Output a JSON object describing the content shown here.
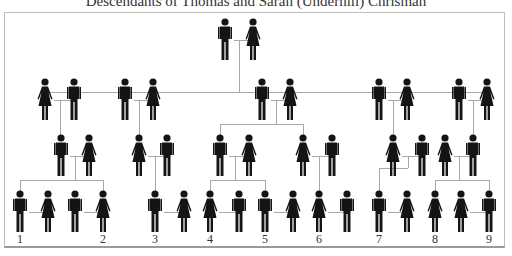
{
  "title": "Descendants of Thomas and Sarah (Underhill) Chrisman",
  "colors": {
    "figure": "#141414",
    "line": "#a9a9a9",
    "border": "#bdbdbd"
  },
  "generations": [
    {
      "row": 1,
      "figures": [
        {
          "id": "g1-m",
          "sex": "male",
          "x": 225,
          "y": 18
        },
        {
          "id": "g1-f",
          "sex": "female",
          "x": 253,
          "y": 18
        }
      ]
    },
    {
      "row": 2,
      "figures": [
        {
          "id": "g2-a-f",
          "sex": "female",
          "x": 45,
          "y": 78
        },
        {
          "id": "g2-a-m",
          "sex": "male",
          "x": 74,
          "y": 78
        },
        {
          "id": "g2-b-m",
          "sex": "male",
          "x": 125,
          "y": 78
        },
        {
          "id": "g2-b-f",
          "sex": "female",
          "x": 153,
          "y": 78
        },
        {
          "id": "g2-c-m",
          "sex": "male",
          "x": 262,
          "y": 78
        },
        {
          "id": "g2-c-f",
          "sex": "female",
          "x": 290,
          "y": 78
        },
        {
          "id": "g2-d-m",
          "sex": "male",
          "x": 379,
          "y": 78
        },
        {
          "id": "g2-d-f",
          "sex": "female",
          "x": 407,
          "y": 78
        },
        {
          "id": "g2-e-m",
          "sex": "male",
          "x": 459,
          "y": 78
        },
        {
          "id": "g2-e-f",
          "sex": "female",
          "x": 487,
          "y": 78
        }
      ]
    },
    {
      "row": 3,
      "figures": [
        {
          "id": "g3-a-m",
          "sex": "male",
          "x": 61,
          "y": 134
        },
        {
          "id": "g3-a-f",
          "sex": "female",
          "x": 89,
          "y": 134
        },
        {
          "id": "g3-b-f",
          "sex": "female",
          "x": 139,
          "y": 134
        },
        {
          "id": "g3-b-m",
          "sex": "male",
          "x": 167,
          "y": 134
        },
        {
          "id": "g3-c1-m",
          "sex": "male",
          "x": 220,
          "y": 134
        },
        {
          "id": "g3-c1-f",
          "sex": "female",
          "x": 249,
          "y": 134
        },
        {
          "id": "g3-c2-f",
          "sex": "female",
          "x": 303,
          "y": 134
        },
        {
          "id": "g3-c2-m",
          "sex": "male",
          "x": 332,
          "y": 134
        },
        {
          "id": "g3-d-f",
          "sex": "female",
          "x": 393,
          "y": 134
        },
        {
          "id": "g3-d-m",
          "sex": "male",
          "x": 422,
          "y": 134
        },
        {
          "id": "g3-e-f",
          "sex": "female",
          "x": 445,
          "y": 134
        },
        {
          "id": "g3-e-m",
          "sex": "male",
          "x": 473,
          "y": 134
        }
      ]
    },
    {
      "row": 4,
      "figures": [
        {
          "id": "g4-1",
          "sex": "male",
          "x": 20,
          "y": 190,
          "label": "1"
        },
        {
          "id": "g4-1s",
          "sex": "female",
          "x": 48,
          "y": 190
        },
        {
          "id": "g4-2s",
          "sex": "male",
          "x": 75,
          "y": 190
        },
        {
          "id": "g4-2",
          "sex": "female",
          "x": 103,
          "y": 190,
          "label": "2"
        },
        {
          "id": "g4-3",
          "sex": "male",
          "x": 155,
          "y": 190,
          "label": "3"
        },
        {
          "id": "g4-3s",
          "sex": "female",
          "x": 184,
          "y": 190
        },
        {
          "id": "g4-4",
          "sex": "female",
          "x": 210,
          "y": 190,
          "label": "4"
        },
        {
          "id": "g4-4s",
          "sex": "male",
          "x": 239,
          "y": 190
        },
        {
          "id": "g4-5",
          "sex": "male",
          "x": 265,
          "y": 190,
          "label": "5"
        },
        {
          "id": "g4-5s",
          "sex": "female",
          "x": 293,
          "y": 190
        },
        {
          "id": "g4-6",
          "sex": "female",
          "x": 319,
          "y": 190,
          "label": "6"
        },
        {
          "id": "g4-6s",
          "sex": "male",
          "x": 347,
          "y": 190
        },
        {
          "id": "g4-7",
          "sex": "male",
          "x": 379,
          "y": 190,
          "label": "7"
        },
        {
          "id": "g4-7s",
          "sex": "female",
          "x": 407,
          "y": 190
        },
        {
          "id": "g4-8",
          "sex": "female",
          "x": 435,
          "y": 190,
          "label": "8"
        },
        {
          "id": "g4-8s",
          "sex": "female",
          "x": 461,
          "y": 190
        },
        {
          "id": "g4-9",
          "sex": "male",
          "x": 489,
          "y": 190,
          "label": "9"
        }
      ]
    }
  ],
  "labels": [
    "1",
    "2",
    "3",
    "4",
    "5",
    "6",
    "7",
    "8",
    "9"
  ],
  "lines": [
    {
      "x1": 234,
      "y1": 40,
      "x2": 253,
      "y2": 40
    },
    {
      "x1": 239,
      "y1": 40,
      "x2": 239,
      "y2": 92
    },
    {
      "x1": 45,
      "y1": 92,
      "x2": 487,
      "y2": 92
    },
    {
      "x1": 45,
      "y1": 92,
      "x2": 45,
      "y2": 100
    },
    {
      "x1": 125,
      "y1": 92,
      "x2": 125,
      "y2": 100
    },
    {
      "x1": 262,
      "y1": 92,
      "x2": 262,
      "y2": 100
    },
    {
      "x1": 379,
      "y1": 92,
      "x2": 379,
      "y2": 100
    },
    {
      "x1": 487,
      "y1": 92,
      "x2": 487,
      "y2": 100
    },
    {
      "x1": 54,
      "y1": 100,
      "x2": 74,
      "y2": 100
    },
    {
      "x1": 60,
      "y1": 100,
      "x2": 60,
      "y2": 136
    },
    {
      "x1": 134,
      "y1": 100,
      "x2": 153,
      "y2": 100
    },
    {
      "x1": 139,
      "y1": 100,
      "x2": 139,
      "y2": 136
    },
    {
      "x1": 271,
      "y1": 100,
      "x2": 290,
      "y2": 100
    },
    {
      "x1": 276,
      "y1": 100,
      "x2": 276,
      "y2": 124
    },
    {
      "x1": 220,
      "y1": 124,
      "x2": 303,
      "y2": 124
    },
    {
      "x1": 220,
      "y1": 124,
      "x2": 220,
      "y2": 136
    },
    {
      "x1": 303,
      "y1": 124,
      "x2": 303,
      "y2": 136
    },
    {
      "x1": 388,
      "y1": 100,
      "x2": 407,
      "y2": 100
    },
    {
      "x1": 393,
      "y1": 100,
      "x2": 393,
      "y2": 136
    },
    {
      "x1": 468,
      "y1": 100,
      "x2": 487,
      "y2": 100
    },
    {
      "x1": 473,
      "y1": 100,
      "x2": 473,
      "y2": 136
    },
    {
      "x1": 70,
      "y1": 156,
      "x2": 89,
      "y2": 156
    },
    {
      "x1": 75,
      "y1": 156,
      "x2": 75,
      "y2": 180
    },
    {
      "x1": 20,
      "y1": 180,
      "x2": 103,
      "y2": 180
    },
    {
      "x1": 20,
      "y1": 180,
      "x2": 20,
      "y2": 192
    },
    {
      "x1": 103,
      "y1": 180,
      "x2": 103,
      "y2": 192
    },
    {
      "x1": 148,
      "y1": 156,
      "x2": 167,
      "y2": 156
    },
    {
      "x1": 155,
      "y1": 156,
      "x2": 155,
      "y2": 192
    },
    {
      "x1": 229,
      "y1": 156,
      "x2": 249,
      "y2": 156
    },
    {
      "x1": 235,
      "y1": 156,
      "x2": 235,
      "y2": 180
    },
    {
      "x1": 210,
      "y1": 180,
      "x2": 265,
      "y2": 180
    },
    {
      "x1": 210,
      "y1": 180,
      "x2": 210,
      "y2": 192
    },
    {
      "x1": 265,
      "y1": 180,
      "x2": 265,
      "y2": 192
    },
    {
      "x1": 312,
      "y1": 156,
      "x2": 332,
      "y2": 156
    },
    {
      "x1": 319,
      "y1": 156,
      "x2": 319,
      "y2": 192
    },
    {
      "x1": 402,
      "y1": 156,
      "x2": 422,
      "y2": 156
    },
    {
      "x1": 408,
      "y1": 156,
      "x2": 408,
      "y2": 168
    },
    {
      "x1": 379,
      "y1": 168,
      "x2": 408,
      "y2": 168
    },
    {
      "x1": 379,
      "y1": 168,
      "x2": 379,
      "y2": 192
    },
    {
      "x1": 454,
      "y1": 156,
      "x2": 473,
      "y2": 156
    },
    {
      "x1": 459,
      "y1": 156,
      "x2": 459,
      "y2": 180
    },
    {
      "x1": 435,
      "y1": 180,
      "x2": 489,
      "y2": 180
    },
    {
      "x1": 435,
      "y1": 180,
      "x2": 435,
      "y2": 192
    },
    {
      "x1": 489,
      "y1": 180,
      "x2": 489,
      "y2": 192
    },
    {
      "x1": 29,
      "y1": 212,
      "x2": 48,
      "y2": 212
    },
    {
      "x1": 84,
      "y1": 212,
      "x2": 103,
      "y2": 212
    },
    {
      "x1": 164,
      "y1": 212,
      "x2": 184,
      "y2": 212
    },
    {
      "x1": 219,
      "y1": 212,
      "x2": 239,
      "y2": 212
    },
    {
      "x1": 274,
      "y1": 212,
      "x2": 293,
      "y2": 212
    },
    {
      "x1": 328,
      "y1": 212,
      "x2": 347,
      "y2": 212
    },
    {
      "x1": 388,
      "y1": 212,
      "x2": 407,
      "y2": 212
    },
    {
      "x1": 470,
      "y1": 212,
      "x2": 489,
      "y2": 212
    }
  ],
  "label_y": 232
}
